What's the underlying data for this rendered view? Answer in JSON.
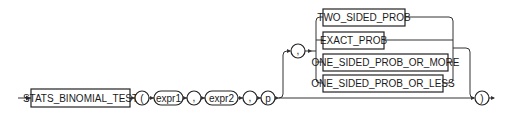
{
  "diagram": {
    "type": "railroad-syntax",
    "function_keyword": "STATS_BINOMIAL_TEST",
    "open_paren": "(",
    "close_paren": ")",
    "args": [
      "expr1",
      "expr2",
      "p"
    ],
    "separators": [
      ",",
      ",",
      ","
    ],
    "optional_comma": ",",
    "options": [
      "TWO_SIDED_PROB",
      "EXACT_PROB",
      "ONE_SIDED_PROB_OR_MORE",
      "ONE_SIDED_PROB_OR_LESS"
    ]
  }
}
